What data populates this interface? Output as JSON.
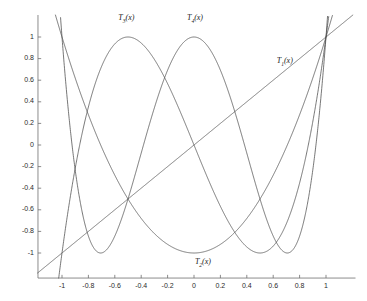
{
  "chart_data": {
    "type": "line",
    "title": "",
    "xlabel": "",
    "ylabel": "",
    "xlim": [
      -1.22,
      1.24
    ],
    "ylim": [
      -1.22,
      1.24
    ],
    "grid": false,
    "legend_position": "inline-annotations",
    "background_color": "#ffffff",
    "line_color": "#4a4a4a",
    "axis_color": "#6e6e6e",
    "x_ticks": [
      -1,
      -0.8,
      -0.6,
      -0.4,
      -0.2,
      0,
      0.2,
      0.4,
      0.6,
      0.8,
      1
    ],
    "x_tick_labels": [
      "-1",
      "-0.8",
      "-0.6",
      "-0.4",
      "-0.2",
      "0",
      "0.2",
      "0.4",
      "0.6",
      "0.8",
      "1"
    ],
    "y_ticks": [
      -1,
      -0.8,
      -0.6,
      -0.4,
      -0.2,
      0,
      0.2,
      0.4,
      0.6,
      0.8,
      1
    ],
    "y_tick_labels": [
      "-1",
      "-0.8",
      "-0.6",
      "-0.4",
      "-0.2",
      "0",
      "0.2",
      "0.4",
      "0.6",
      "0.8",
      "1"
    ],
    "series": [
      {
        "name": "T1",
        "label": "T",
        "sub": "1",
        "label_suffix": "(x)",
        "formula": "x",
        "degree": 1,
        "label_x": 0.71,
        "label_y": 0.78
      },
      {
        "name": "T2",
        "label": "T",
        "sub": "2",
        "label_suffix": "(x)",
        "formula": "2x^2 - 1",
        "degree": 2,
        "label_x": 0.09,
        "label_y": -1.08
      },
      {
        "name": "T3",
        "label": "T",
        "sub": "3",
        "label_suffix": "(x)",
        "formula": "4x^3 - 3x",
        "degree": 3,
        "label_x": -0.49,
        "label_y": 1.18
      },
      {
        "name": "T4",
        "label": "T",
        "sub": "4",
        "label_suffix": "(x)",
        "formula": "8x^4 - 8x^2 + 1",
        "degree": 4,
        "label_x": 0.03,
        "label_y": 1.18
      }
    ]
  }
}
